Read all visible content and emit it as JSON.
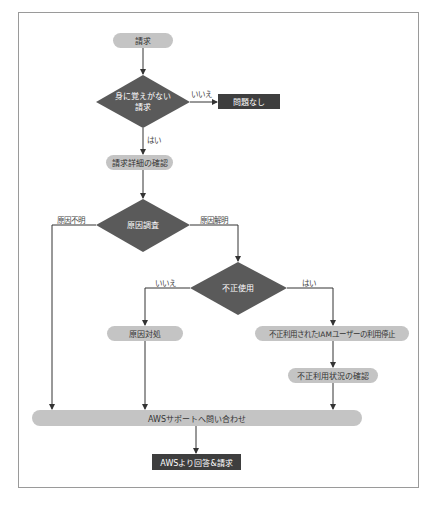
{
  "caption_cut": "",
  "colors": {
    "frame": "#9a9a9a",
    "pill_fill": "#c4c4c4",
    "pill_text": "#333333",
    "dark_fill": "#3e3e3e",
    "diamond_fill": "#5a5a5a",
    "line": "#333333"
  },
  "nodes": {
    "start": "請求",
    "decision_unrecognized": [
      "身に覚えがない",
      "請求"
    ],
    "no_problem": "問題なし",
    "check_details": "請求詳細の確認",
    "decision_investigate": "原因調査",
    "decision_fraud": "不正使用",
    "handle_cause": "原因対処",
    "stop_iam_user": "不正利用されたIAMユーザーの利用停止",
    "check_fraud_status": "不正利用状況の確認",
    "contact_support": "AWSサポートへ問い合わせ",
    "aws_response": "AWSより回答&請求"
  },
  "edge_labels": {
    "unrecognized_no": "いいえ",
    "unrecognized_yes": "はい",
    "cause_unknown": "原因不明",
    "cause_found": "原因解明",
    "fraud_no": "いいえ",
    "fraud_yes": "はい"
  }
}
